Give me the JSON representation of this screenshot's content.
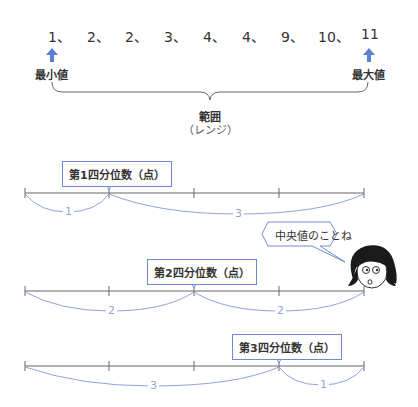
{
  "data_sequence": {
    "values": [
      "1、",
      "2、",
      "2、",
      "3、",
      "4、",
      "4、",
      "9、",
      "10、",
      "11"
    ],
    "min_label": "最小値",
    "max_label": "最大値",
    "range_label": "範囲",
    "range_sub_label": "（レンジ）"
  },
  "quartiles": [
    {
      "label": "第1四分位数（点）",
      "left_count": "1",
      "right_count": "3"
    },
    {
      "label": "第2四分位数（点）",
      "left_count": "2",
      "right_count": "2"
    },
    {
      "label": "第3四分位数（点）",
      "left_count": "3",
      "right_count": "1"
    }
  ],
  "character": {
    "speech": "中央値のことね"
  },
  "colors": {
    "accent_blue": "#5b7fd1",
    "brace_blue": "#8ea4dc",
    "line_gray": "#666666"
  }
}
